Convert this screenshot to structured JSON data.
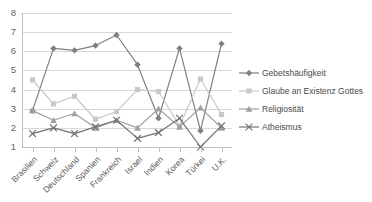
{
  "chart_data": {
    "type": "line",
    "title": "",
    "xlabel": "",
    "ylabel": "",
    "ylim": [
      1,
      8
    ],
    "yticks": [
      1,
      2,
      3,
      4,
      5,
      6,
      7,
      8
    ],
    "grid": true,
    "legend_position": "right",
    "categories": [
      "Brasilien",
      "Schweiz",
      "Deutschland",
      "Spanien",
      "Frankreich",
      "Israel",
      "Indien",
      "Korea",
      "Türkei",
      "U.K."
    ],
    "series": [
      {
        "name": "Gebetshäufigkeit",
        "color": "#808080",
        "marker": "diamond",
        "values": [
          2.9,
          6.15,
          6.05,
          6.3,
          6.85,
          5.3,
          2.5,
          6.15,
          1.85,
          6.4
        ]
      },
      {
        "name": "Glaube an Existenz Gottes",
        "color": "#c8c8c8",
        "marker": "square",
        "values": [
          4.5,
          3.25,
          3.65,
          2.45,
          2.85,
          4.0,
          3.9,
          2.1,
          4.55,
          2.7
        ]
      },
      {
        "name": "Religiosität",
        "color": "#a0a0a0",
        "marker": "triangle",
        "values": [
          2.9,
          2.4,
          2.75,
          2.0,
          2.4,
          2.0,
          3.0,
          2.05,
          3.05,
          2.0
        ]
      },
      {
        "name": "Atheismus",
        "color": "#737373",
        "marker": "cross",
        "values": [
          1.7,
          2.0,
          1.7,
          2.05,
          2.4,
          1.45,
          1.75,
          2.5,
          1.0,
          2.1
        ]
      }
    ]
  },
  "legend": {
    "items": [
      {
        "label": "Gebetshäufigkeit"
      },
      {
        "label": "Glaube an Existenz Gottes"
      },
      {
        "label": "Religiosität"
      },
      {
        "label": "Atheismus"
      }
    ]
  },
  "axis": {
    "y_tick_labels": [
      "8",
      "7",
      "6",
      "5",
      "4",
      "3",
      "2",
      "1"
    ]
  }
}
